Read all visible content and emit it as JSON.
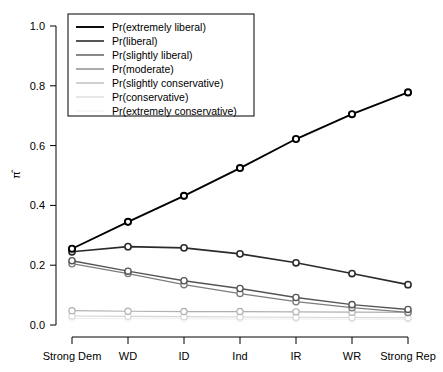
{
  "chart_data": {
    "type": "line",
    "title": "",
    "xlabel": "",
    "ylabel": "π̂",
    "categories": [
      "Strong Dem",
      "WD",
      "ID",
      "Ind",
      "IR",
      "WR",
      "Strong Rep"
    ],
    "ylim": [
      0.0,
      1.0
    ],
    "yticks": [
      "0.0",
      "0.2",
      "0.4",
      "0.6",
      "0.8",
      "1.0"
    ],
    "ytick_values": [
      0.0,
      0.2,
      0.4,
      0.6,
      0.8,
      1.0
    ],
    "grid": false,
    "legend_position": "top-left",
    "marker": "open-circle",
    "series": [
      {
        "name": "Pr(extremely liberal)",
        "color": "#000000",
        "width": 1.9,
        "values": [
          0.255,
          0.345,
          0.432,
          0.525,
          0.622,
          0.705,
          0.778
        ]
      },
      {
        "name": "Pr(liberal)",
        "color": "#2b2b2b",
        "width": 1.6,
        "values": [
          0.245,
          0.262,
          0.258,
          0.238,
          0.208,
          0.172,
          0.135
        ]
      },
      {
        "name": "Pr(slightly liberal)",
        "color": "#555555",
        "width": 1.4,
        "values": [
          0.215,
          0.18,
          0.148,
          0.122,
          0.092,
          0.068,
          0.052
        ]
      },
      {
        "name": "Pr(moderate)",
        "color": "#7d7d7d",
        "width": 1.3,
        "values": [
          0.205,
          0.172,
          0.135,
          0.105,
          0.078,
          0.058,
          0.042
        ]
      },
      {
        "name": "Pr(slightly conservative)",
        "color": "#b0b0b0",
        "width": 1.2,
        "values": [
          0.048,
          0.046,
          0.045,
          0.045,
          0.044,
          0.043,
          0.042
        ]
      },
      {
        "name": "Pr(conservative)",
        "color": "#d4d4d4",
        "width": 1.1,
        "values": [
          0.03,
          0.029,
          0.028,
          0.027,
          0.026,
          0.025,
          0.024
        ]
      },
      {
        "name": "Pr(extremely conservative)",
        "color": "#efefef",
        "width": 1.0,
        "values": [
          0.022,
          0.021,
          0.021,
          0.02,
          0.02,
          0.019,
          0.019
        ]
      }
    ]
  },
  "axes": {
    "y_axis_label": "π̂",
    "y_tick_labels": [
      "1.0",
      "0.8",
      "0.6",
      "0.4",
      "0.2",
      "0.0"
    ],
    "x_tick_labels": [
      "Strong Dem",
      "WD",
      "ID",
      "Ind",
      "IR",
      "WR",
      "Strong Rep"
    ]
  },
  "legend": {
    "items": [
      "Pr(extremely liberal)",
      "Pr(liberal)",
      "Pr(slightly liberal)",
      "Pr(moderate)",
      "Pr(slightly conservative)",
      "Pr(conservative)",
      "Pr(extremely conservative)"
    ]
  }
}
